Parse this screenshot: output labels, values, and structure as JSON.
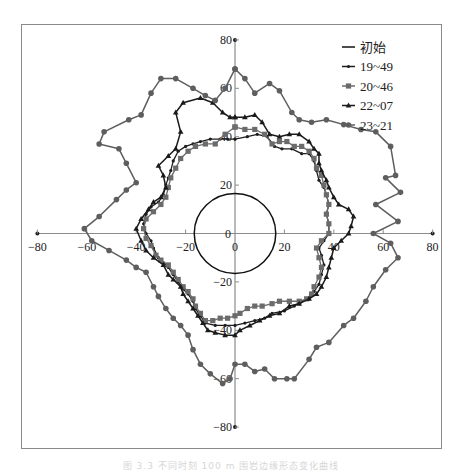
{
  "caption": "图 3.3 不同时刻 100 m 围岩边缘形态变化曲线",
  "chart_data": {
    "type": "scatter",
    "subtype": "polar-contour",
    "title": "",
    "xlabel": "",
    "ylabel": "",
    "xlim": [
      -80,
      80
    ],
    "ylim": [
      -80,
      80
    ],
    "x_ticks": [
      -80,
      -60,
      -40,
      -20,
      0,
      20,
      40,
      60,
      80
    ],
    "y_ticks": [
      -80,
      -60,
      -40,
      -20,
      0,
      20,
      40,
      60,
      80
    ],
    "x_tick_labels": [
      "-80",
      "-60",
      "-40",
      "-20",
      "0",
      "20",
      "40",
      "60",
      "80"
    ],
    "y_tick_labels": [
      "-80",
      "-60",
      "-40",
      "-20",
      "0",
      "20",
      "40",
      "60",
      "80"
    ],
    "origin_labels": [
      "0",
      "0"
    ],
    "grid": false,
    "legend_position": "top-right",
    "legend": [
      "初始",
      "19~49",
      "20~46",
      "22~07",
      "23~21"
    ],
    "series": [
      {
        "name": "初始",
        "marker": "none",
        "shape": "circle",
        "radius": 16.5
      },
      {
        "name": "19~49",
        "marker": "small-diamond",
        "points": [
          [
            0,
            39
          ],
          [
            5,
            40
          ],
          [
            9,
            41
          ],
          [
            13,
            40
          ],
          [
            16,
            36
          ],
          [
            19,
            35
          ],
          [
            23,
            35
          ],
          [
            27,
            33
          ],
          [
            30,
            33
          ],
          [
            32,
            30
          ],
          [
            33,
            26
          ],
          [
            34,
            22
          ],
          [
            36,
            19
          ],
          [
            37,
            16
          ],
          [
            38,
            12
          ],
          [
            37,
            8
          ],
          [
            38,
            4
          ],
          [
            38,
            0
          ],
          [
            36,
            -3
          ],
          [
            34,
            -6
          ],
          [
            35,
            -9
          ],
          [
            36,
            -13
          ],
          [
            35,
            -17
          ],
          [
            34,
            -21
          ],
          [
            32,
            -24
          ],
          [
            30,
            -27
          ],
          [
            27,
            -28
          ],
          [
            24,
            -30
          ],
          [
            20,
            -32
          ],
          [
            15,
            -33
          ],
          [
            12,
            -35
          ],
          [
            8,
            -36
          ],
          [
            4,
            -37
          ],
          [
            0,
            -38
          ],
          [
            -4,
            -38
          ],
          [
            -8,
            -38
          ],
          [
            -12,
            -37
          ],
          [
            -14,
            -34
          ],
          [
            -16,
            -31
          ],
          [
            -17,
            -28
          ],
          [
            -19,
            -25
          ],
          [
            -21,
            -23
          ],
          [
            -23,
            -20
          ],
          [
            -25,
            -17
          ],
          [
            -27,
            -14
          ],
          [
            -29,
            -12
          ],
          [
            -31,
            -10
          ],
          [
            -33,
            -6
          ],
          [
            -34,
            -3
          ],
          [
            -36,
            0
          ],
          [
            -37,
            4
          ],
          [
            -36,
            8
          ],
          [
            -34,
            11
          ],
          [
            -31,
            13
          ],
          [
            -29,
            16
          ],
          [
            -28,
            20
          ],
          [
            -27,
            23
          ],
          [
            -26,
            26
          ],
          [
            -25,
            30
          ],
          [
            -23,
            34
          ],
          [
            -20,
            36
          ],
          [
            -17,
            37
          ],
          [
            -14,
            38
          ],
          [
            -10,
            39
          ],
          [
            -6,
            39
          ],
          [
            -3,
            39
          ],
          [
            0,
            39
          ]
        ]
      },
      {
        "name": "20~46",
        "marker": "square",
        "points": [
          [
            0,
            44
          ],
          [
            4,
            43
          ],
          [
            8,
            43
          ],
          [
            12,
            41
          ],
          [
            15,
            37
          ],
          [
            18,
            38
          ],
          [
            21,
            38
          ],
          [
            24,
            36
          ],
          [
            27,
            36
          ],
          [
            30,
            34
          ],
          [
            32,
            31
          ],
          [
            33,
            27
          ],
          [
            35,
            24
          ],
          [
            36,
            20
          ],
          [
            37,
            16
          ],
          [
            38,
            12
          ],
          [
            37,
            8
          ],
          [
            38,
            4
          ],
          [
            38,
            0
          ],
          [
            35,
            -3
          ],
          [
            33,
            -6
          ],
          [
            34,
            -10
          ],
          [
            35,
            -14
          ],
          [
            34,
            -18
          ],
          [
            32,
            -22
          ],
          [
            31,
            -25
          ],
          [
            29,
            -27
          ],
          [
            26,
            -28
          ],
          [
            22,
            -28
          ],
          [
            18,
            -28
          ],
          [
            15,
            -29
          ],
          [
            11,
            -30
          ],
          [
            8,
            -30
          ],
          [
            5,
            -31
          ],
          [
            2,
            -33
          ],
          [
            0,
            -34
          ],
          [
            -3,
            -35
          ],
          [
            -6,
            -35
          ],
          [
            -9,
            -36
          ],
          [
            -12,
            -36
          ],
          [
            -14,
            -33
          ],
          [
            -16,
            -30
          ],
          [
            -17,
            -27
          ],
          [
            -19,
            -24
          ],
          [
            -21,
            -22
          ],
          [
            -23,
            -19
          ],
          [
            -25,
            -16
          ],
          [
            -27,
            -13
          ],
          [
            -30,
            -11
          ],
          [
            -32,
            -9
          ],
          [
            -34,
            -5
          ],
          [
            -36,
            -2
          ],
          [
            -37,
            2
          ],
          [
            -36,
            6
          ],
          [
            -33,
            9
          ],
          [
            -30,
            12
          ],
          [
            -28,
            15
          ],
          [
            -27,
            19
          ],
          [
            -26,
            23
          ],
          [
            -24,
            27
          ],
          [
            -22,
            31
          ],
          [
            -19,
            34
          ],
          [
            -16,
            36
          ],
          [
            -12,
            37
          ],
          [
            -8,
            37
          ],
          [
            -4,
            41
          ],
          [
            0,
            44
          ]
        ]
      },
      {
        "name": "22~07",
        "marker": "triangle",
        "points": [
          [
            0,
            48
          ],
          [
            4,
            48
          ],
          [
            8,
            49
          ],
          [
            11,
            46
          ],
          [
            14,
            41
          ],
          [
            18,
            40
          ],
          [
            22,
            41
          ],
          [
            26,
            41
          ],
          [
            30,
            38
          ],
          [
            32,
            35
          ],
          [
            34,
            33
          ],
          [
            34,
            29
          ],
          [
            35,
            26
          ],
          [
            37,
            22
          ],
          [
            38,
            19
          ],
          [
            40,
            15
          ],
          [
            42,
            12
          ],
          [
            46,
            10
          ],
          [
            48,
            7
          ],
          [
            47,
            3
          ],
          [
            46,
            0
          ],
          [
            43,
            -3
          ],
          [
            40,
            -6
          ],
          [
            39,
            -10
          ],
          [
            38,
            -14
          ],
          [
            37,
            -18
          ],
          [
            35,
            -22
          ],
          [
            33,
            -25
          ],
          [
            30,
            -27
          ],
          [
            26,
            -29
          ],
          [
            22,
            -30
          ],
          [
            18,
            -33
          ],
          [
            14,
            -34
          ],
          [
            10,
            -36
          ],
          [
            6,
            -38
          ],
          [
            2,
            -40
          ],
          [
            0,
            -42
          ],
          [
            -4,
            -42
          ],
          [
            -8,
            -41
          ],
          [
            -11,
            -40
          ],
          [
            -13,
            -37
          ],
          [
            -15,
            -34
          ],
          [
            -17,
            -31
          ],
          [
            -19,
            -28
          ],
          [
            -21,
            -25
          ],
          [
            -22,
            -22
          ],
          [
            -25,
            -19
          ],
          [
            -27,
            -17
          ],
          [
            -29,
            -13
          ],
          [
            -33,
            -10
          ],
          [
            -36,
            -7
          ],
          [
            -38,
            -3
          ],
          [
            -40,
            2
          ],
          [
            -38,
            6
          ],
          [
            -35,
            10
          ],
          [
            -33,
            13
          ],
          [
            -30,
            15
          ],
          [
            -28,
            19
          ],
          [
            -29,
            24
          ],
          [
            -31,
            28
          ],
          [
            -27,
            32
          ],
          [
            -24,
            35
          ],
          [
            -22,
            42
          ],
          [
            -24,
            50
          ],
          [
            -21,
            54
          ],
          [
            -14,
            56
          ],
          [
            -9,
            54
          ],
          [
            -5,
            50
          ],
          [
            -2,
            48
          ],
          [
            0,
            48
          ]
        ]
      },
      {
        "name": "23~21",
        "marker": "circle",
        "points": [
          [
            0,
            68
          ],
          [
            4,
            64
          ],
          [
            8,
            58
          ],
          [
            14,
            62
          ],
          [
            18,
            59
          ],
          [
            23,
            50
          ],
          [
            26,
            47
          ],
          [
            31,
            46
          ],
          [
            37,
            47
          ],
          [
            44,
            45
          ],
          [
            51,
            43
          ],
          [
            57,
            42
          ],
          [
            63,
            36
          ],
          [
            65,
            24
          ],
          [
            61,
            23
          ],
          [
            67,
            17
          ],
          [
            57,
            12
          ],
          [
            66,
            5
          ],
          [
            56,
            0
          ],
          [
            63,
            -4
          ],
          [
            66,
            -10
          ],
          [
            61,
            -15
          ],
          [
            56,
            -22
          ],
          [
            53,
            -28
          ],
          [
            48,
            -35
          ],
          [
            44,
            -38
          ],
          [
            38,
            -45
          ],
          [
            33,
            -47
          ],
          [
            30,
            -52
          ],
          [
            24,
            -60
          ],
          [
            21,
            -60
          ],
          [
            16,
            -60
          ],
          [
            12,
            -56
          ],
          [
            8,
            -57
          ],
          [
            4,
            -54
          ],
          [
            0,
            -54
          ],
          [
            -2,
            -60
          ],
          [
            -5,
            -62
          ],
          [
            -10,
            -58
          ],
          [
            -14,
            -54
          ],
          [
            -17,
            -48
          ],
          [
            -19,
            -42
          ],
          [
            -22,
            -38
          ],
          [
            -25,
            -35
          ],
          [
            -28,
            -31
          ],
          [
            -31,
            -26
          ],
          [
            -33,
            -22
          ],
          [
            -36,
            -16
          ],
          [
            -40,
            -14
          ],
          [
            -44,
            -11
          ],
          [
            -51,
            -7
          ],
          [
            -58,
            -3
          ],
          [
            -61,
            2
          ],
          [
            -55,
            7
          ],
          [
            -48,
            14
          ],
          [
            -44,
            18
          ],
          [
            -40,
            21
          ],
          [
            -44,
            29
          ],
          [
            -47,
            35
          ],
          [
            -55,
            37
          ],
          [
            -53,
            42
          ],
          [
            -43,
            47
          ],
          [
            -38,
            49
          ],
          [
            -34,
            58
          ],
          [
            -30,
            64
          ],
          [
            -24,
            64
          ],
          [
            -17,
            60
          ],
          [
            -12,
            57
          ],
          [
            -8,
            55
          ],
          [
            -4,
            60
          ],
          [
            0,
            68
          ]
        ]
      }
    ]
  }
}
